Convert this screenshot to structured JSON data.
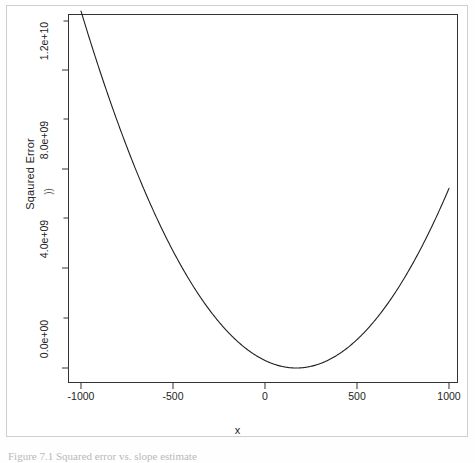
{
  "figure": {
    "caption": "Figure 7.1 Squared error vs. slope estimate",
    "axis_titles": {
      "x": "x",
      "y": "Sqaured Error"
    },
    "scan_artifact": "))"
  },
  "chart_data": {
    "type": "line",
    "title": "",
    "subtitle": "",
    "xlabel": "x",
    "ylabel": "Sqaured Error",
    "xlim": [
      -1100,
      1100
    ],
    "ylim": [
      -400000000,
      13800000000
    ],
    "grid": false,
    "legend": null,
    "x_ticks": [
      -1000,
      -500,
      0,
      500,
      1000
    ],
    "x_tick_labels": [
      "-1000",
      "-500",
      "0",
      "500",
      "1000"
    ],
    "y_ticks": [
      0,
      4000000000,
      8000000000,
      12000000000
    ],
    "y_tick_labels": [
      "0.0e+00",
      "4.0e+09",
      "8.0e+09",
      "1.2e+10"
    ],
    "y_minor_ticks": [
      2000000000,
      6000000000,
      10000000000,
      14000000000
    ],
    "series": [
      {
        "name": "squared error",
        "curve": "parabola",
        "vertex_x": 170,
        "vertex_y": 0,
        "coefficient_a": 10500,
        "x": [
          -1000,
          -900,
          -800,
          -700,
          -600,
          -500,
          -400,
          -300,
          -200,
          -100,
          0,
          100,
          170,
          200,
          300,
          400,
          500,
          600,
          700,
          800,
          900,
          1000
        ],
        "values": [
          14000000000,
          11980000000,
          10100000000,
          8370000000,
          6780000000,
          5340000000,
          4040000000,
          2890000000,
          1880000000,
          1020000000,
          303000000,
          52000000,
          0,
          9000000,
          179000000,
          497000000,
          959000000,
          1570000000,
          2320000000,
          3220000000,
          4260000000,
          5450000000
        ]
      }
    ]
  }
}
